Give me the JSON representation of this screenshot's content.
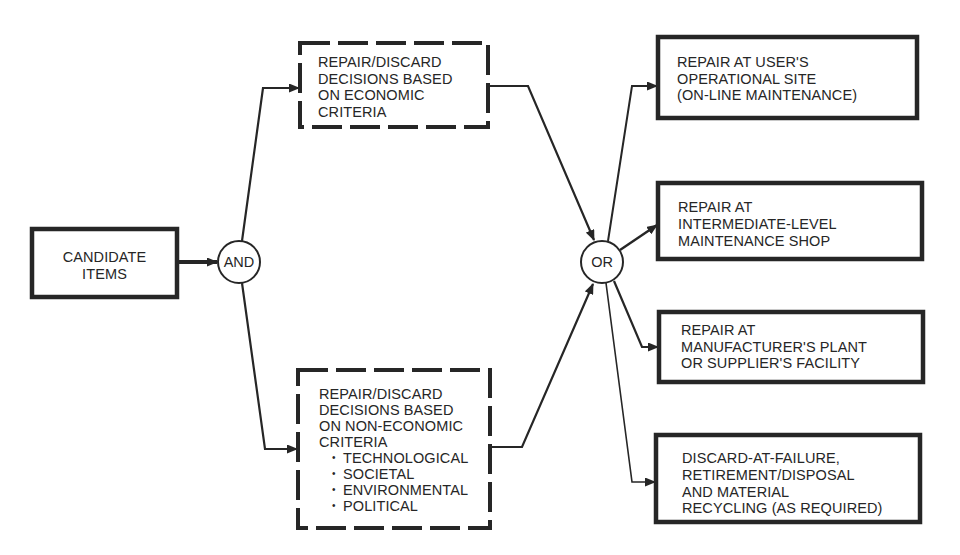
{
  "colors": {
    "ink": "#262626",
    "background": "#ffffff"
  },
  "diagram": {
    "candidate": {
      "lines": [
        "CANDIDATE",
        "ITEMS"
      ]
    },
    "and_gate": {
      "label": "AND"
    },
    "or_gate": {
      "label": "OR"
    },
    "economic": {
      "lines": [
        "REPAIR/DISCARD",
        "DECISIONS BASED",
        "ON ECONOMIC",
        "CRITERIA"
      ]
    },
    "non_economic": {
      "lines": [
        "REPAIR/DISCARD",
        "DECISIONS BASED",
        "ON NON-ECONOMIC",
        "CRITERIA"
      ],
      "bullet_glyph": "•",
      "bullets": [
        "TECHNOLOGICAL",
        "SOCIETAL",
        "ENVIRONMENTAL",
        "POLITICAL"
      ]
    },
    "outcomes": [
      {
        "lines": [
          "REPAIR AT USER'S",
          "OPERATIONAL SITE",
          "(ON-LINE MAINTENANCE)"
        ]
      },
      {
        "lines": [
          "REPAIR AT",
          "INTERMEDIATE-LEVEL",
          "MAINTENANCE SHOP"
        ]
      },
      {
        "lines": [
          "REPAIR AT",
          "MANUFACTURER'S PLANT",
          "OR SUPPLIER'S FACILITY"
        ]
      },
      {
        "lines": [
          "DISCARD-AT-FAILURE,",
          "RETIREMENT/DISPOSAL",
          "AND MATERIAL",
          "RECYCLING (AS REQUIRED)"
        ]
      }
    ]
  }
}
